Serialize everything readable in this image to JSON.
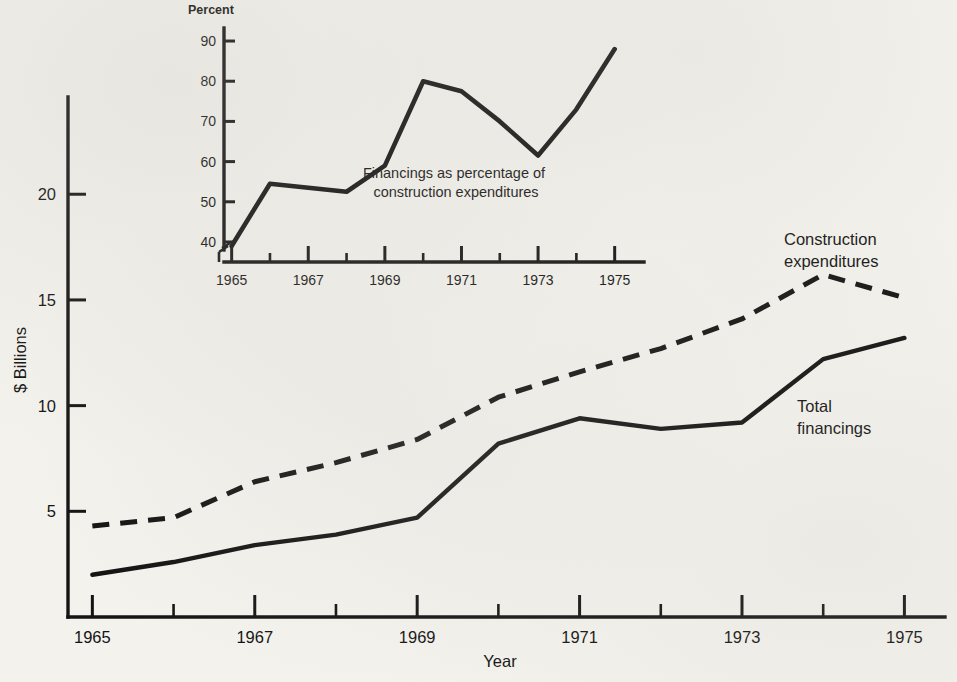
{
  "chart_data": [
    {
      "type": "line",
      "name": "main-chart",
      "title": "",
      "xlabel": "Year",
      "ylabel": "$ Billions",
      "x": [
        1965,
        1966,
        1967,
        1968,
        1969,
        1970,
        1971,
        1972,
        1973,
        1974,
        1975
      ],
      "xlim": [
        1964.7,
        1975.5
      ],
      "ylim": [
        0,
        24.6
      ],
      "xticks_major": [
        1965,
        1967,
        1969,
        1971,
        1973,
        1975
      ],
      "xticks_major_labels": [
        "1965",
        "1967",
        "1969",
        "1971",
        "1973",
        "1975"
      ],
      "xticks_minor": [
        1966,
        1968,
        1970,
        1972,
        1974
      ],
      "yticks": [
        5,
        10,
        15,
        20
      ],
      "ytick_labels": [
        "5",
        "10",
        "15",
        "20"
      ],
      "grid": false,
      "legend": "inline-labels",
      "series": [
        {
          "name": "Construction expenditures",
          "style": "dashed",
          "label_x": 1973.2,
          "label_y": 19.6,
          "values": [
            4.3,
            4.7,
            6.4,
            7.3,
            8.4,
            10.4,
            11.6,
            12.7,
            14.1,
            16.2,
            15.1
          ]
        },
        {
          "name": "Total financings",
          "style": "solid",
          "label_x": 1973.6,
          "label_y": 11.6,
          "values": [
            2.0,
            2.6,
            3.4,
            3.9,
            4.7,
            8.2,
            9.4,
            8.9,
            9.2,
            12.2,
            13.2
          ]
        }
      ]
    },
    {
      "type": "line",
      "name": "inset-chart",
      "title": "",
      "xlabel": "",
      "ylabel": "Percent",
      "annotation": "Financings as percentage of\nconstruction expenditures",
      "annotation_line1": "Financings as percentage of",
      "annotation_line2": "construction expenditures",
      "x": [
        1965,
        1966,
        1967,
        1968,
        1969,
        1970,
        1971,
        1972,
        1973,
        1974,
        1975
      ],
      "xlim": [
        1964.8,
        1975.4
      ],
      "ylim": [
        38,
        92
      ],
      "axis_break": true,
      "xticks_major": [
        1965,
        1967,
        1969,
        1971,
        1973,
        1975
      ],
      "xticks_major_labels": [
        "1965",
        "1967",
        "1969",
        "1971",
        "1973",
        "1975"
      ],
      "xticks_minor": [
        1966,
        1968,
        1970,
        1972,
        1974
      ],
      "yticks": [
        40,
        50,
        60,
        70,
        80,
        90
      ],
      "ytick_labels": [
        "40",
        "50",
        "60",
        "70",
        "80",
        "90"
      ],
      "grid": false,
      "series": [
        {
          "name": "Financings as percentage of construction expenditures",
          "style": "solid",
          "values": [
            39,
            54.5,
            53.5,
            52.5,
            59,
            80,
            77.5,
            70,
            61.5,
            73,
            88
          ]
        }
      ]
    }
  ],
  "colors": {
    "ink": "#131313",
    "paper": "#f3f2ed"
  }
}
